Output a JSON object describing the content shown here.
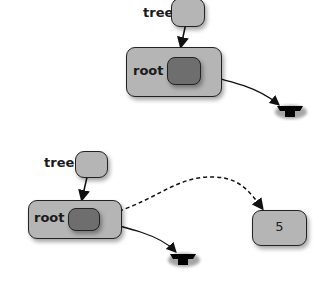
{
  "diagram": {
    "type": "pointer-diagram",
    "panels": [
      {
        "variable_label": "tree",
        "node_label": "root",
        "root_pointer": "null"
      },
      {
        "variable_label": "tree",
        "node_label": "root",
        "root_pointer": "null",
        "new_pointer_target_value": "5"
      }
    ]
  },
  "colors": {
    "node_fill": "#b5b5b5",
    "pointer_cell_fill": "#6e6e6e",
    "stroke": "#222222"
  }
}
